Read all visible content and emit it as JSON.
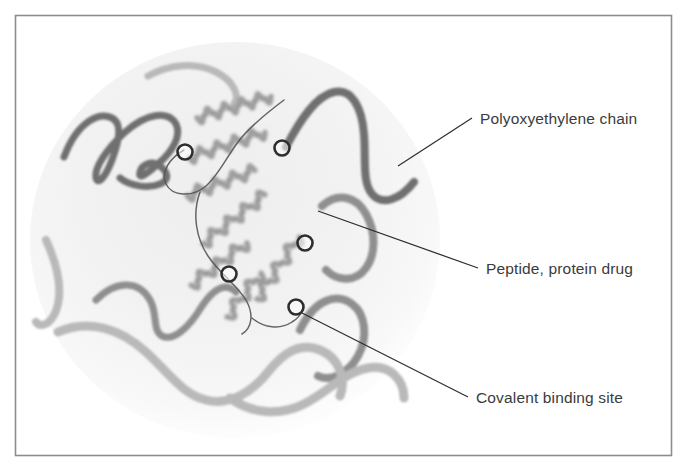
{
  "figure": {
    "frame": {
      "border_color": "#8c8c8c",
      "background_color": "#ffffff"
    },
    "micelle": {
      "name": "hydration-sphere",
      "fill_center_color": "#f3f3f3",
      "fill_edge_color": "#fafafa",
      "center_x": 235,
      "center_y": 240,
      "radius_x": 205,
      "radius_y": 198
    },
    "colors": {
      "peg_chain_dark": "#6f6f6f",
      "peg_chain_mid": "#8f8f8f",
      "peg_chain_light": "#b9b9b9",
      "protein_ribbon": "#9a9a9a",
      "protein_loop": "#555555",
      "binding_site_ring": "#2e2e2e",
      "leader_line": "#2e2e2e",
      "label_text": "#3b3b3b"
    }
  },
  "labels": [
    {
      "id": "polyoxyethylene-chain",
      "text": "Polyoxyethylene chain",
      "x": 480,
      "y": 124,
      "leader": {
        "x1": 398,
        "y1": 166,
        "x2": 472,
        "y2": 118
      }
    },
    {
      "id": "peptide-protein-drug",
      "text": "Peptide, protein drug",
      "x": 486,
      "y": 274,
      "leader": {
        "x1": 318,
        "y1": 211,
        "x2": 478,
        "y2": 268
      }
    },
    {
      "id": "covalent-binding-site",
      "text": "Covalent binding site",
      "x": 476,
      "y": 403,
      "leader": {
        "x1": 302,
        "y1": 313,
        "x2": 468,
        "y2": 397
      }
    }
  ],
  "binding_sites": [
    {
      "id": "site-1",
      "x": 185,
      "y": 152,
      "r": 7.5
    },
    {
      "id": "site-2",
      "x": 282,
      "y": 148,
      "r": 7.5
    },
    {
      "id": "site-3",
      "x": 305,
      "y": 243,
      "r": 7.5
    },
    {
      "id": "site-4",
      "x": 229,
      "y": 274,
      "r": 7.5
    },
    {
      "id": "site-5",
      "x": 296,
      "y": 307,
      "r": 7.5
    }
  ],
  "peg_chains": [
    {
      "id": "peg-chain-upper-left",
      "shade": "peg_chain_dark",
      "width": 7,
      "path": "M 64 157 C 78 120 100 112 112 118 C 122 123 120 139 112 160 C 106 176 98 186 96 178 C 94 168 106 150 124 133 C 146 113 168 110 176 124 C 182 136 172 152 158 164 C 146 175 138 180 140 172 C 142 164 152 160 160 166 C 168 172 170 180 160 184 C 148 189 130 186 120 178"
    },
    {
      "id": "peg-chain-upper-right",
      "shade": "peg_chain_dark",
      "width": 8,
      "path": "M 286 147 C 300 120 316 96 334 92 C 352 88 362 108 364 134 C 366 158 362 182 372 194 C 382 206 400 200 414 182"
    },
    {
      "id": "peg-chain-right-mid",
      "shade": "peg_chain_mid",
      "width": 8,
      "path": "M 322 206 C 338 192 356 196 366 214 C 376 232 376 254 366 268 C 356 282 338 282 326 270"
    },
    {
      "id": "peg-chain-right-lower",
      "shade": "peg_chain_mid",
      "width": 8,
      "path": "M 300 330 C 314 300 336 292 352 304 C 366 314 368 338 358 356 C 348 374 330 382 318 376"
    },
    {
      "id": "peg-chain-center-left",
      "shade": "peg_chain_mid",
      "width": 7,
      "path": "M 96 300 C 118 278 140 282 150 300 C 158 314 152 330 162 336 C 174 342 190 326 202 306 C 214 288 226 282 236 292"
    },
    {
      "id": "peg-chain-bottom",
      "shade": "peg_chain_light",
      "width": 9,
      "path": "M 58 332 C 90 318 122 330 146 352 C 168 372 182 394 206 400 C 230 406 252 392 268 372 C 284 352 300 342 320 350 C 340 358 346 380 340 396"
    },
    {
      "id": "peg-chain-bottom-right",
      "shade": "peg_chain_light",
      "width": 9,
      "path": "M 230 398 C 252 414 280 416 304 404 C 328 392 344 372 368 368 C 390 364 404 380 404 398"
    },
    {
      "id": "peg-chain-left-lower",
      "shade": "peg_chain_light",
      "width": 8,
      "path": "M 46 240 C 56 262 62 286 58 304 C 54 322 42 330 36 322"
    },
    {
      "id": "peg-chain-top-faint",
      "shade": "peg_chain_light",
      "width": 7,
      "path": "M 148 76 C 170 64 196 62 216 72 C 234 81 240 96 234 104"
    }
  ],
  "protein_helices": [
    {
      "id": "helix-1",
      "x1": 196,
      "y1": 118,
      "x2": 272,
      "y2": 96,
      "turns": 9
    },
    {
      "id": "helix-2",
      "x1": 188,
      "y1": 158,
      "x2": 266,
      "y2": 132,
      "turns": 9
    },
    {
      "id": "helix-3",
      "x1": 186,
      "y1": 196,
      "x2": 256,
      "y2": 170,
      "turns": 8
    },
    {
      "id": "helix-4",
      "x1": 202,
      "y1": 244,
      "x2": 266,
      "y2": 194,
      "turns": 8
    },
    {
      "id": "helix-5",
      "x1": 190,
      "y1": 286,
      "x2": 248,
      "y2": 242,
      "turns": 7
    },
    {
      "id": "helix-6",
      "x1": 256,
      "y1": 300,
      "x2": 300,
      "y2": 236,
      "turns": 7
    },
    {
      "id": "helix-7",
      "x1": 226,
      "y1": 318,
      "x2": 262,
      "y2": 272,
      "turns": 5
    }
  ],
  "protein_loops": [
    {
      "id": "loop-upper",
      "path": "M 284 100 C 268 112 250 126 238 142 C 226 158 218 176 206 186 C 192 198 172 196 166 184 C 160 172 170 158 184 150"
    },
    {
      "id": "loop-center",
      "path": "M 200 192 C 192 214 196 238 208 256 C 220 274 236 284 246 300 C 254 314 252 328 242 334"
    },
    {
      "id": "loop-lower",
      "path": "M 252 318 C 264 328 280 330 292 322 C 302 316 306 306 300 300"
    }
  ]
}
